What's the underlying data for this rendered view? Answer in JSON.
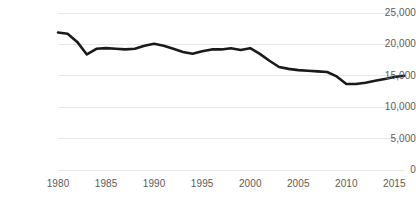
{
  "chart_data": {
    "type": "line",
    "title": "",
    "subtitle": "",
    "xlabel": "",
    "ylabel": "",
    "xlim": [
      1980,
      2016
    ],
    "ylim": [
      0,
      25000
    ],
    "grid": "horizontal",
    "legend": "none",
    "series_color": "#1a1a1a",
    "gridline_color": "#e8e8e8",
    "tick_label_color": "#5b5b5b",
    "x_tick_labels": [
      "1980",
      "1985",
      "1990",
      "1995",
      "2000",
      "2005",
      "2010",
      "2015"
    ],
    "x_ticks": [
      1980,
      1985,
      1990,
      1995,
      2000,
      2005,
      2010,
      2015
    ],
    "y_tick_labels": [
      "0",
      "5,000",
      "10,000",
      "15,000",
      "20,000",
      "25,000"
    ],
    "y_ticks": [
      0,
      5000,
      10000,
      15000,
      20000,
      25000
    ],
    "series": [
      {
        "name": "series-1",
        "x": [
          1980,
          1981,
          1982,
          1983,
          1984,
          1985,
          1986,
          1987,
          1988,
          1989,
          1990,
          1991,
          1992,
          1993,
          1994,
          1995,
          1996,
          1997,
          1998,
          1999,
          2000,
          2001,
          2002,
          2003,
          2004,
          2005,
          2006,
          2007,
          2008,
          2009,
          2010,
          2011,
          2012,
          2013,
          2014,
          2015,
          2016
        ],
        "values": [
          21900,
          21700,
          20400,
          18400,
          19300,
          19400,
          19300,
          19200,
          19300,
          19800,
          20100,
          19800,
          19300,
          18800,
          18500,
          18900,
          19200,
          19200,
          19400,
          19100,
          19400,
          18500,
          17400,
          16400,
          16100,
          15900,
          15800,
          15700,
          15600,
          14900,
          13700,
          13700,
          13900,
          14200,
          14500,
          14800,
          15000
        ]
      }
    ]
  }
}
